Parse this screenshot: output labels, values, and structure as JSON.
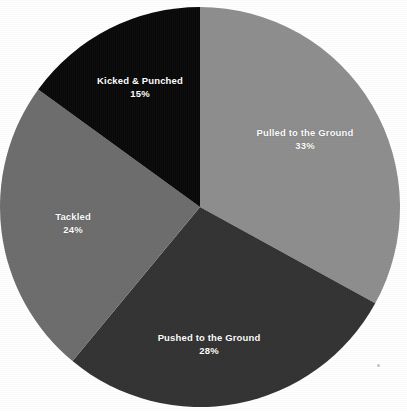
{
  "chart_data": {
    "type": "pie",
    "title": "",
    "subtitle": "",
    "xlabel": "",
    "ylabel": "",
    "legend": "none",
    "grid": false,
    "units": "percent",
    "start_angle_deg": 0,
    "direction": "clockwise",
    "categories": [
      "Pulled to the Ground",
      "Pushed to the Ground",
      "Tackled",
      "Kicked & Punched"
    ],
    "values": [
      33,
      28,
      24,
      15
    ],
    "slices": [
      {
        "label": "Pulled to the Ground",
        "value": 33,
        "value_text": "33%",
        "color": "#8e8e8e",
        "start_deg": 0,
        "end_deg": 118.8,
        "label_x": 305,
        "label_y": 140
      },
      {
        "label": "Pushed to the Ground",
        "value": 28,
        "value_text": "28%",
        "color": "#333333",
        "start_deg": 118.8,
        "end_deg": 219.6,
        "label_x": 209,
        "label_y": 345
      },
      {
        "label": "Tackled",
        "value": 24,
        "value_text": "24%",
        "color": "#6d6d6d",
        "start_deg": 219.6,
        "end_deg": 306.0,
        "label_x": 73,
        "label_y": 224
      },
      {
        "label": "Kicked & Punched",
        "value": 15,
        "value_text": "15%",
        "color": "#0a0a0a",
        "start_deg": 306.0,
        "end_deg": 360.0,
        "label_x": 140,
        "label_y": 88
      }
    ],
    "geometry": {
      "center_x": 200,
      "center_y": 207,
      "radius": 200
    },
    "background_color": "#ffffff",
    "label_color": "#ffffff"
  }
}
